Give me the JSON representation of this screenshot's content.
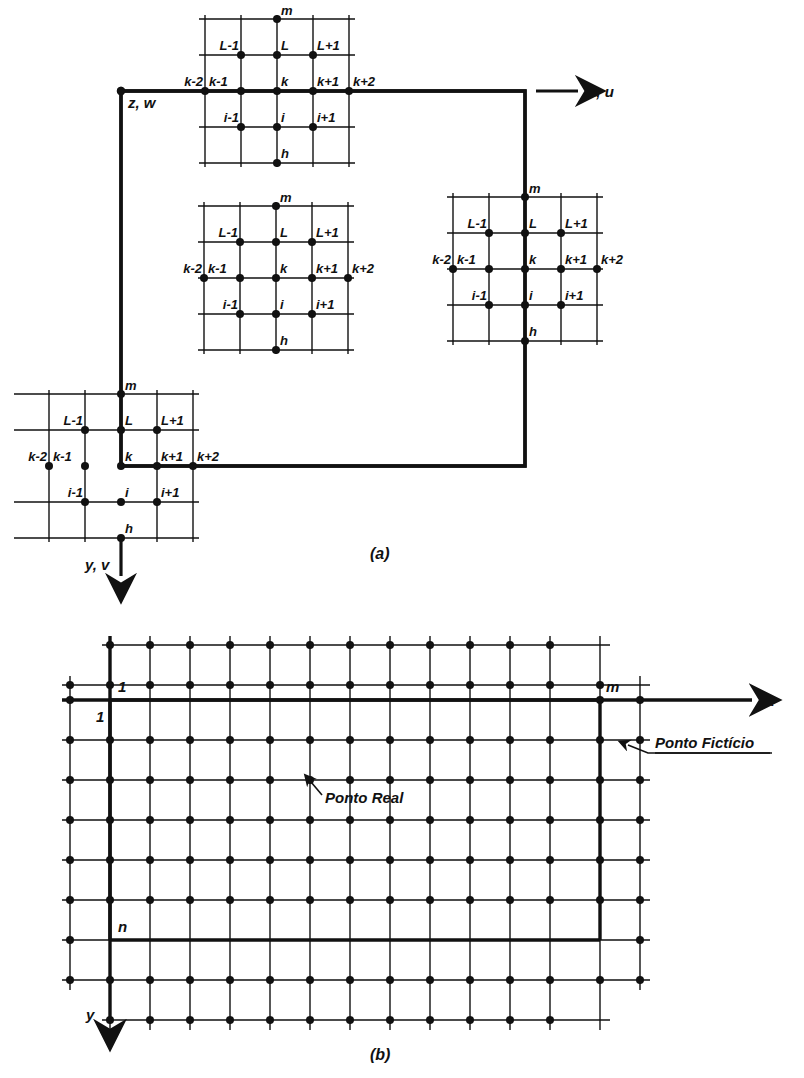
{
  "figure": {
    "panels": [
      {
        "id": "a",
        "caption": "(a)"
      },
      {
        "id": "b",
        "caption": "(b)"
      }
    ]
  },
  "panel_a": {
    "caption": "(a)",
    "origin_label": "z, w",
    "x_axis_label": "x, u",
    "y_axis_label": "y, v",
    "stencil_labels": {
      "top": "m",
      "bottom": "h",
      "upper_left": "L-1",
      "upper_center": "L",
      "upper_right": "L+1",
      "row_far_left": "k-2",
      "row_left": "k-1",
      "row_center": "k",
      "row_right": "k+1",
      "row_far_right": "k+2",
      "lower_left": "i-1",
      "lower_center": "i",
      "lower_right": "i+1"
    },
    "stencils": [
      {
        "name": "top-boundary-stencil",
        "position": "top"
      },
      {
        "name": "interior-stencil",
        "position": "center"
      },
      {
        "name": "right-boundary-stencil",
        "position": "right"
      },
      {
        "name": "corner-boundary-stencil",
        "position": "bottom-left"
      }
    ]
  },
  "panel_b": {
    "caption": "(b)",
    "x_axis_label": "x",
    "y_axis_label": "y",
    "first_column_label": "1",
    "first_row_label": "1",
    "last_column_label": "m",
    "last_row_label": "n",
    "callouts": [
      {
        "name": "ponto-real",
        "text": "Ponto Real"
      },
      {
        "name": "ponto-ficticio",
        "text": "Ponto Fictício"
      }
    ]
  },
  "colors": {
    "ink": "#111111",
    "background": "#ffffff"
  }
}
